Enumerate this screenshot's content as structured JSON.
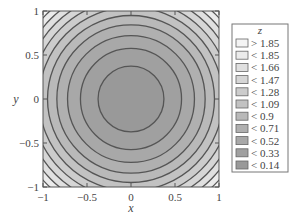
{
  "chart_data": {
    "type": "contour",
    "title": "",
    "function": "z = x^2 + y^2",
    "xlabel": "x",
    "ylabel": "y",
    "xlim": [
      -1,
      1
    ],
    "ylim": [
      -1,
      1
    ],
    "xticks": [
      -1,
      -0.5,
      0,
      0.5,
      1
    ],
    "yticks": [
      -1,
      -0.5,
      0,
      0.5,
      1
    ],
    "xtick_labels": [
      "−1",
      "−0.5",
      "0",
      "0.5",
      "1"
    ],
    "ytick_labels": [
      "1",
      "0.5",
      "0",
      "−0.5",
      "−1"
    ],
    "levels": [
      0.14,
      0.33,
      0.52,
      0.71,
      0.9,
      1.09,
      1.28,
      1.47,
      1.66,
      1.85
    ],
    "legend": {
      "title": "z",
      "position": "right",
      "entries": [
        {
          "label": "> 1.85",
          "color": "#f4f4f4"
        },
        {
          "label": "< 1.85",
          "color": "#ebebeb"
        },
        {
          "label": "< 1.66",
          "color": "#e0e0e0"
        },
        {
          "label": "< 1.47",
          "color": "#d6d6d6"
        },
        {
          "label": "< 1.28",
          "color": "#cccccc"
        },
        {
          "label": "< 1.09",
          "color": "#c2c2c2"
        },
        {
          "label": "< 0.9",
          "color": "#b9b9b9"
        },
        {
          "label": "< 0.71",
          "color": "#b0b0b0"
        },
        {
          "label": "< 0.52",
          "color": "#a8a8a8"
        },
        {
          "label": "< 0.33",
          "color": "#a0a0a0"
        },
        {
          "label": "< 0.14",
          "color": "#999999"
        }
      ]
    },
    "grid": false
  }
}
